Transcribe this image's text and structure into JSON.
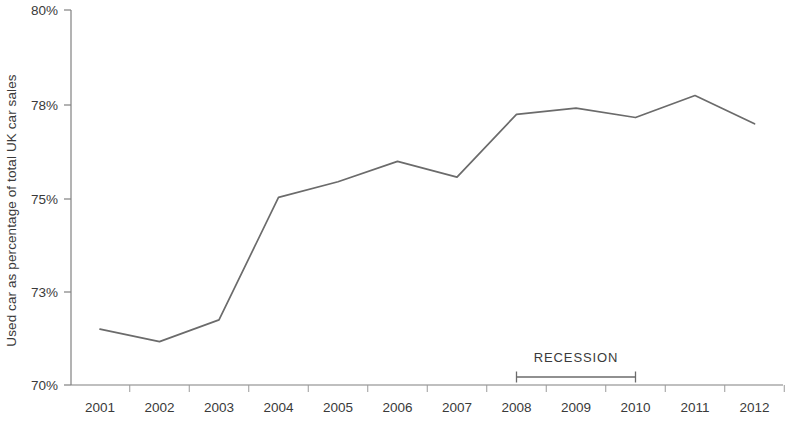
{
  "chart_data": {
    "type": "line",
    "title": "",
    "subtitle": "",
    "xlabel": "",
    "ylabel": "Used car as percentage of total UK car sales",
    "categories": [
      "2001",
      "2002",
      "2003",
      "2004",
      "2005",
      "2006",
      "2007",
      "2008",
      "2009",
      "2010",
      "2011",
      "2012"
    ],
    "series": [
      {
        "name": "Used car as percentage of total UK car sales",
        "values": [
          71.8,
          71.4,
          72.1,
          75.05,
          75.55,
          76.2,
          75.7,
          77.7,
          77.9,
          77.6,
          78.2,
          77.4
        ],
        "color": "#6b6b6b"
      }
    ],
    "y_tick_labels": [
      "80%",
      "78%",
      "75%",
      "73%",
      "70%"
    ],
    "y_tick_values": [
      80,
      78,
      75,
      73,
      70
    ],
    "ylim": [
      70,
      80
    ],
    "grid": false,
    "legend": false,
    "legend_position": "none",
    "annotations": [
      {
        "name": "recession-span",
        "label": "RECESSION",
        "start_category": "2008",
        "end_category": "2010"
      }
    ],
    "colors": {
      "line": "#6b6b6b",
      "axis": "#808080",
      "text": "#3a3a3a",
      "annotation": "#6b6b6b",
      "background": "#ffffff"
    }
  }
}
